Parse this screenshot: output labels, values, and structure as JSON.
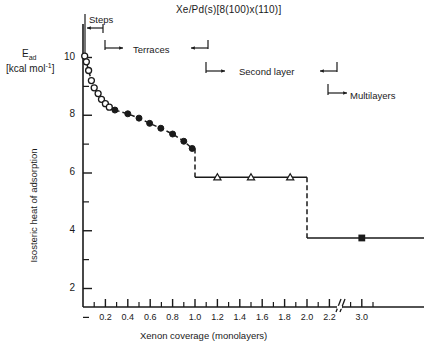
{
  "chart_data": {
    "type": "line",
    "title": "Xe/Pd(s)[8(100)x(110)]",
    "xlabel": "Xenon coverage (monolayers)",
    "ylabel": "Isosteric heat of adsorption",
    "ylabel_symbol": "E",
    "ylabel_symbol_sub": "ad",
    "ylabel_units": "[kcal mol",
    "ylabel_units_sup": "-1",
    "ylabel_units_tail": "]",
    "xlim": [
      0.0,
      3.15
    ],
    "ylim": [
      0.0,
      10.9
    ],
    "grid": false,
    "legend": "none",
    "axis_break": {
      "after": 2.25,
      "before": 2.85,
      "symbol": "//"
    },
    "yticks_major": [
      2,
      4,
      6,
      8,
      10
    ],
    "yticks_minor": [
      1,
      3,
      5,
      7,
      9
    ],
    "xticks_major": [
      0.2,
      0.4,
      0.6,
      0.8,
      1.0,
      1.2,
      1.4,
      1.6,
      1.8,
      2.0,
      2.2,
      3.0
    ],
    "xticks_minor": [
      0.1,
      0.3,
      0.5,
      0.7,
      0.9,
      1.1,
      1.3,
      1.5,
      1.7,
      1.9,
      2.1,
      2.9,
      3.1
    ],
    "xtick_labels": [
      "0.2",
      "0.4",
      "0.6",
      "0.8",
      "1.0",
      "1.2",
      "1.4",
      "1.6",
      "1.8",
      "2.0",
      "2.2",
      "3.0"
    ],
    "series": [
      {
        "name": "Steps (open circles)",
        "marker": "open-circle",
        "x": [
          0.015,
          0.03,
          0.05,
          0.075,
          0.1,
          0.135,
          0.165,
          0.2,
          0.235
        ],
        "y": [
          10.05,
          9.85,
          9.55,
          9.2,
          8.95,
          8.75,
          8.55,
          8.4,
          8.28
        ]
      },
      {
        "name": "Terraces (filled circles)",
        "marker": "filled-circle",
        "x": [
          0.285,
          0.4,
          0.5,
          0.595,
          0.695,
          0.8,
          0.9,
          0.975
        ],
        "y": [
          8.18,
          8.05,
          7.9,
          7.72,
          7.55,
          7.35,
          7.1,
          6.85
        ]
      },
      {
        "name": "Second layer (open triangles)",
        "marker": "open-triangle",
        "x": [
          1.2,
          1.5,
          1.85
        ],
        "y": [
          5.85,
          5.85,
          5.85
        ]
      },
      {
        "name": "Multilayers (filled square)",
        "marker": "filled-square",
        "x": [
          3.0
        ],
        "y": [
          3.75
        ]
      }
    ],
    "steps": [
      {
        "x": 1.0,
        "from": 6.85,
        "to": 5.85
      },
      {
        "x": 2.0,
        "from": 5.85,
        "to": 3.75
      }
    ],
    "plateaus": [
      {
        "y": 5.85,
        "x_start": 1.0,
        "x_end": 2.0
      },
      {
        "y": 3.75,
        "x_start": 2.0,
        "x_end": 3.15
      }
    ]
  },
  "annotations": [
    {
      "label": "Steps",
      "name": "annotation-steps"
    },
    {
      "label": "Terraces",
      "name": "annotation-terraces"
    },
    {
      "label": "Second layer",
      "name": "annotation-second-layer"
    },
    {
      "label": "Multilayers",
      "name": "annotation-multilayers"
    }
  ]
}
